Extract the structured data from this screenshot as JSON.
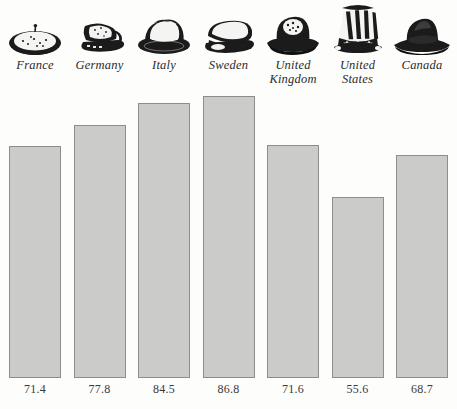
{
  "chart_data": {
    "type": "bar",
    "title": "",
    "subtitle": "",
    "xlabel": "",
    "ylabel": "",
    "grid": false,
    "legend": "none",
    "ylim": [
      0,
      100
    ],
    "categories": [
      "France",
      "Germany",
      "Italy",
      "Sweden",
      "United Kingdom",
      "United States",
      "Canada"
    ],
    "values": [
      71.4,
      77.8,
      84.5,
      86.8,
      71.6,
      55.6,
      68.7
    ],
    "value_labels": [
      "71.4",
      "77.8",
      "84.5",
      "86.8",
      "71.6",
      "55.6",
      "68.7"
    ],
    "bar_color": "#cbcbc9",
    "bar_border_color": "#8d8d8d",
    "background_color": "#fdfdfb"
  },
  "columns": [
    {
      "label_line1": "France",
      "label_line2": "",
      "value": "71.4",
      "icon": "beret-hat-icon"
    },
    {
      "label_line1": "Germany",
      "label_line2": "",
      "value": "77.8",
      "icon": "peaked-cap-hat-icon"
    },
    {
      "label_line1": "Italy",
      "label_line2": "",
      "value": "84.5",
      "icon": "fedora-hat-icon"
    },
    {
      "label_line1": "Sweden",
      "label_line2": "",
      "value": "86.8",
      "icon": "flat-cap-hat-icon"
    },
    {
      "label_line1": "United",
      "label_line2": "Kingdom",
      "value": "71.6",
      "icon": "bowler-hat-icon"
    },
    {
      "label_line1": "United",
      "label_line2": "States",
      "value": "55.6",
      "icon": "uncle-sam-top-hat-icon"
    },
    {
      "label_line1": "Canada",
      "label_line2": "",
      "value": "68.7",
      "icon": "mountie-hat-icon"
    }
  ]
}
